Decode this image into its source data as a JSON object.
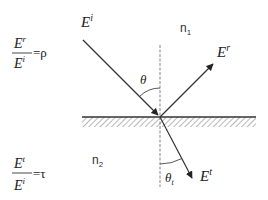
{
  "diagram": {
    "type": "reflection-transmission-at-interface",
    "colors": {
      "line": "#333333",
      "hatch": "#9a9a9a",
      "normal": "#777777",
      "text": "#222222"
    },
    "labels": {
      "incident_base": "E",
      "incident_sup": "i",
      "reflected_base": "E",
      "reflected_sup": "r",
      "transmitted_base": "E",
      "transmitted_sup": "t",
      "medium1_base": "n",
      "medium1_sub": "1",
      "medium2_base": "n",
      "medium2_sub": "2",
      "theta": "θ",
      "theta_t_base": "θ",
      "theta_t_sub": "t"
    },
    "equations": {
      "reflection": {
        "num_base": "E",
        "num_sup": "r",
        "den_base": "E",
        "den_sup": "i",
        "equals": "=",
        "symbol": "ρ"
      },
      "transmission": {
        "num_base": "E",
        "num_sup": "t",
        "den_base": "E",
        "den_sup": "i",
        "equals": "=",
        "symbol": "τ"
      }
    },
    "geometry": {
      "interface_y": 117,
      "interface_x": [
        82,
        256
      ],
      "normal_x": 160,
      "normal_y": [
        45,
        187
      ],
      "incident": [
        [
          83,
          40
        ],
        [
          160,
          117
        ]
      ],
      "reflected": [
        [
          160,
          117
        ],
        [
          214,
          63
        ]
      ],
      "transmitted": [
        [
          160,
          117
        ],
        [
          193,
          180
        ]
      ]
    }
  }
}
